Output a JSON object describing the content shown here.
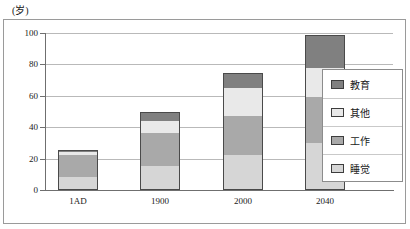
{
  "chart_data": {
    "type": "bar",
    "subtype": "stacked-bar",
    "title": "",
    "unit_label": "(岁)",
    "xlabel": "",
    "ylabel": "",
    "categories": [
      "1AD",
      "1900",
      "2000",
      "2040"
    ],
    "ylim": [
      0,
      100
    ],
    "yticks": [
      0,
      20,
      40,
      60,
      80,
      100
    ],
    "ytick_labels": [
      "0",
      "20",
      "40",
      "60",
      "80",
      "100"
    ],
    "grid": true,
    "legend_position": "right",
    "series": [
      {
        "name": "睡觉",
        "color": "#d6d6d6",
        "values": [
          8,
          15,
          22,
          30
        ]
      },
      {
        "name": "工作",
        "color": "#a9a9a9",
        "values": [
          14,
          21,
          25,
          29
        ]
      },
      {
        "name": "其他",
        "color": "#e9e9e9",
        "values": [
          2,
          8,
          18,
          19
        ]
      },
      {
        "name": "教育",
        "color": "#808080",
        "values": [
          1,
          5,
          9,
          20
        ]
      }
    ],
    "stack_totals": [
      25,
      49,
      74,
      98
    ],
    "legend_order": [
      "教育",
      "其他",
      "工作",
      "睡觉"
    ]
  },
  "legend": {
    "items": [
      {
        "label": "教育",
        "color": "#808080"
      },
      {
        "label": "其他",
        "color": "#e9e9e9"
      },
      {
        "label": "工作",
        "color": "#a9a9a9"
      },
      {
        "label": "睡觉",
        "color": "#d6d6d6"
      }
    ]
  },
  "axis": {
    "unit": "(岁)",
    "y_ticks": [
      "100",
      "80",
      "60",
      "40",
      "20",
      "0"
    ],
    "x_ticks": [
      "1AD",
      "1900",
      "2000",
      "2040"
    ]
  }
}
